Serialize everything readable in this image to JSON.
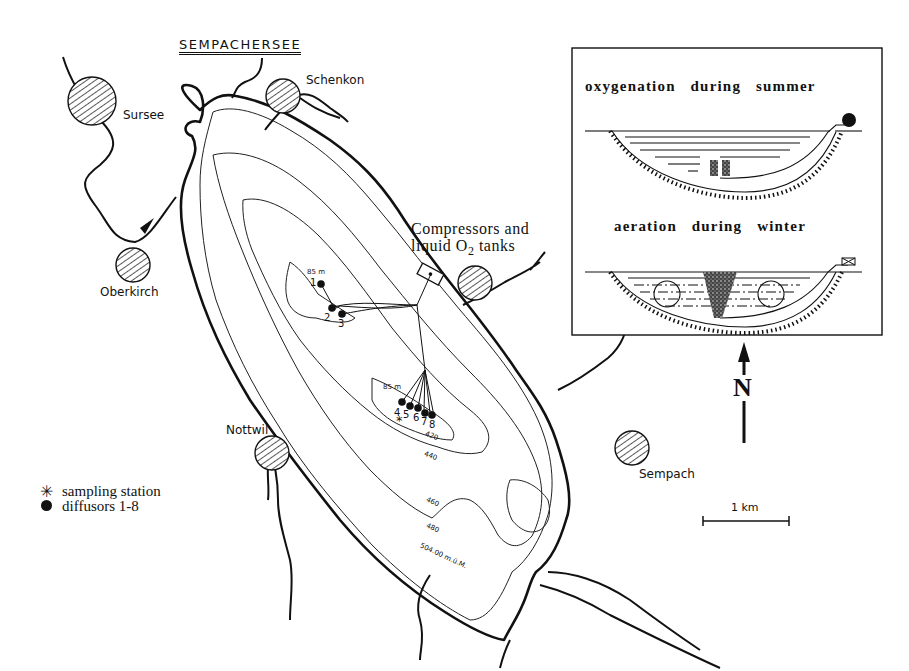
{
  "map": {
    "title": "SEMPACHERSEE",
    "towns": [
      {
        "name": "Sursee"
      },
      {
        "name": "Schenkon"
      },
      {
        "name": "Oberkirch"
      },
      {
        "name": "Nottwil"
      },
      {
        "name": "Sempach"
      }
    ],
    "facility_label": {
      "line1": "Compressors and",
      "line2_prefix": "liquid O",
      "line2_sub": "2",
      "line2_suffix": " tanks"
    },
    "depth_labels": {
      "basin1": "85 m",
      "basin2": "85 m"
    },
    "contours": [
      "420",
      "440",
      "460",
      "480",
      "504.00 m.ü.M."
    ],
    "diffusors": [
      "1",
      "2",
      "3",
      "4",
      "5",
      "6",
      "7",
      "8"
    ],
    "scale_bar": "1 km",
    "north_label": "N",
    "colors": {
      "ink": "#111111",
      "paper": "#ffffff"
    }
  },
  "inset": {
    "summer_title": "oxygenation   during   summer",
    "winter_title": "aeration   during   winter"
  },
  "legend": {
    "items": [
      {
        "symbol": "asterisk",
        "label": "sampling station"
      },
      {
        "symbol": "filled-circle",
        "label": "diffusors 1-8"
      }
    ]
  }
}
